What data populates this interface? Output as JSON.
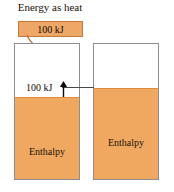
{
  "figure": {
    "title": "Energy as heat",
    "heat_bar": {
      "label": "100 kJ",
      "color": "#eda766",
      "border_color": "#c47a3a"
    },
    "gap": {
      "label": "100 kJ",
      "arrow": "up-arrow"
    },
    "vessels": [
      {
        "id": "left",
        "fill_label": "Enthalpy",
        "fill_color": "#f0a860",
        "border_color": "#8d8d91"
      },
      {
        "id": "right",
        "fill_label": "Enthalpy",
        "fill_color": "#f0a860",
        "border_color": "#8d8d91"
      }
    ],
    "icons": {
      "curved_arrow": "curved-down-arrow-icon",
      "level_connector": "level-connector-line"
    }
  }
}
